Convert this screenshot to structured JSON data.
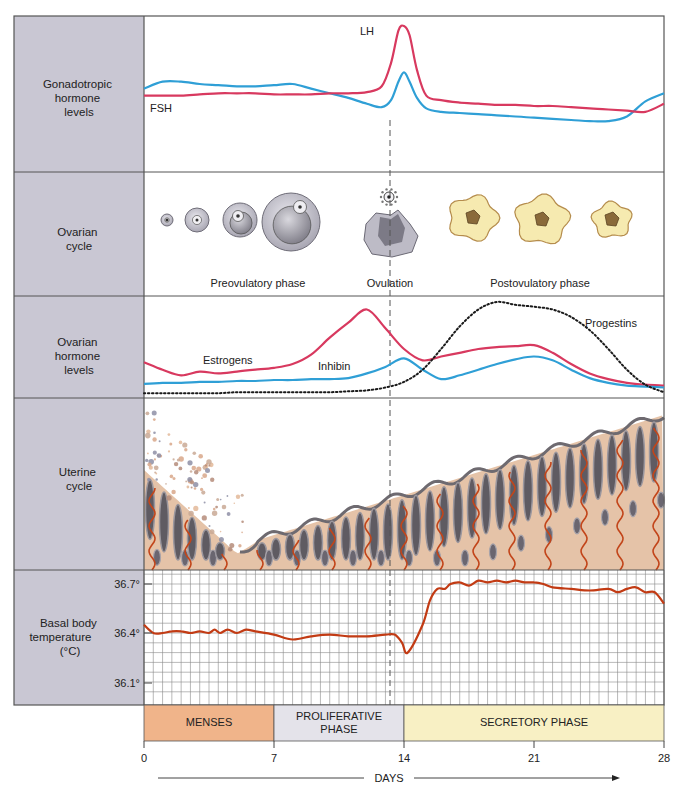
{
  "rows": {
    "gonadotropic": {
      "label_lines": [
        "Gonadotropic",
        "hormone",
        "levels"
      ],
      "fsh_label": "FSH",
      "lh_label": "LH"
    },
    "ovarian_cycle": {
      "label_lines": [
        "Ovarian",
        "cycle"
      ],
      "preovulatory_label": "Preovulatory phase",
      "ovulation_label": "Ovulation",
      "postovulatory_label": "Postovulatory phase"
    },
    "ovarian_hormones": {
      "label_lines": [
        "Ovarian",
        "hormone",
        "levels"
      ],
      "estrogens_label": "Estrogens",
      "inhibin_label": "Inhibin",
      "progestins_label": "Progestins"
    },
    "uterine_cycle": {
      "label_lines": [
        "Uterine",
        "cycle"
      ]
    },
    "bbt": {
      "label_lines": [
        "Basal body",
        "temperature",
        "(°C)"
      ],
      "tick_labels": [
        "36.7°",
        "36.4°",
        "36.1°"
      ]
    }
  },
  "phases": [
    {
      "label_lines": [
        "MENSES"
      ],
      "start_day": 0,
      "end_day": 7,
      "color": "#f0b48a"
    },
    {
      "label_lines": [
        "PROLIFERATIVE",
        "PHASE"
      ],
      "start_day": 7,
      "end_day": 14,
      "color": "#e4e3ea"
    },
    {
      "label_lines": [
        "SECRETORY PHASE"
      ],
      "start_day": 14,
      "end_day": 28,
      "color": "#f8f0c4"
    }
  ],
  "axis": {
    "ticks": [
      "0",
      "7",
      "14",
      "21",
      "28"
    ],
    "label": "DAYS"
  },
  "colors": {
    "fsh": "#2f9fd6",
    "lh": "#d8395f",
    "estrogens": "#d8395f",
    "inhibin": "#2f9fd6",
    "progestins": "#1a1a1a",
    "bbt": "#c23b14",
    "label_panel": "#c9c7d3",
    "frame": "#555555"
  },
  "chart_data": [
    {
      "type": "line",
      "title": "Gonadotropic hormone levels",
      "x": [
        0,
        1,
        2,
        3,
        4,
        5,
        6,
        7,
        8,
        9,
        10,
        11,
        12,
        12.8,
        13.3,
        13.7,
        14,
        14.3,
        14.7,
        15.2,
        16,
        17,
        18,
        19,
        20,
        21,
        22,
        23,
        24,
        25,
        26,
        27,
        28
      ],
      "series": [
        {
          "name": "FSH",
          "values": [
            0.46,
            0.52,
            0.52,
            0.5,
            0.49,
            0.48,
            0.48,
            0.49,
            0.5,
            0.46,
            0.42,
            0.38,
            0.33,
            0.3,
            0.36,
            0.52,
            0.6,
            0.52,
            0.38,
            0.29,
            0.26,
            0.25,
            0.24,
            0.23,
            0.22,
            0.21,
            0.2,
            0.19,
            0.18,
            0.18,
            0.22,
            0.35,
            0.42
          ]
        },
        {
          "name": "LH",
          "values": [
            0.4,
            0.4,
            0.4,
            0.41,
            0.42,
            0.42,
            0.42,
            0.41,
            0.41,
            0.41,
            0.42,
            0.42,
            0.43,
            0.48,
            0.68,
            0.96,
            1.0,
            0.92,
            0.62,
            0.4,
            0.36,
            0.34,
            0.33,
            0.32,
            0.32,
            0.31,
            0.31,
            0.3,
            0.29,
            0.28,
            0.27,
            0.26,
            0.33
          ]
        }
      ],
      "xlabel": "DAYS",
      "ylabel": "Gonadotropic hormone levels",
      "xlim": [
        0,
        28
      ],
      "ylim": [
        0,
        1
      ],
      "annotations": [
        "FSH",
        "LH"
      ]
    },
    {
      "type": "line",
      "title": "Ovarian hormone levels",
      "x": [
        0,
        1,
        2,
        3,
        4,
        5,
        6,
        7,
        8,
        9,
        10,
        11,
        12,
        13,
        14,
        15,
        16,
        17,
        18,
        19,
        20,
        21,
        22,
        23,
        24,
        25,
        26,
        27,
        28
      ],
      "series": [
        {
          "name": "Estrogens",
          "values": [
            0.36,
            0.28,
            0.22,
            0.26,
            0.24,
            0.26,
            0.28,
            0.3,
            0.34,
            0.44,
            0.62,
            0.78,
            0.92,
            0.72,
            0.5,
            0.38,
            0.42,
            0.46,
            0.5,
            0.52,
            0.53,
            0.54,
            0.46,
            0.34,
            0.24,
            0.18,
            0.14,
            0.12,
            0.11
          ]
        },
        {
          "name": "Inhibin",
          "values": [
            0.13,
            0.14,
            0.14,
            0.15,
            0.15,
            0.16,
            0.16,
            0.17,
            0.17,
            0.18,
            0.18,
            0.19,
            0.24,
            0.31,
            0.4,
            0.28,
            0.18,
            0.22,
            0.28,
            0.34,
            0.39,
            0.42,
            0.38,
            0.28,
            0.19,
            0.14,
            0.11,
            0.1,
            0.09
          ]
        },
        {
          "name": "Progestins",
          "values": [
            0.03,
            0.03,
            0.03,
            0.03,
            0.03,
            0.04,
            0.04,
            0.04,
            0.04,
            0.04,
            0.04,
            0.05,
            0.06,
            0.09,
            0.15,
            0.28,
            0.5,
            0.74,
            0.92,
            1.0,
            0.97,
            0.95,
            0.92,
            0.84,
            0.7,
            0.5,
            0.28,
            0.12,
            0.04
          ]
        }
      ],
      "xlabel": "DAYS",
      "ylabel": "Ovarian hormone levels",
      "xlim": [
        0,
        28
      ],
      "ylim": [
        0,
        1
      ],
      "annotations": [
        "Estrogens",
        "Inhibin",
        "Progestins"
      ]
    },
    {
      "type": "line",
      "title": "Basal body temperature (°C)",
      "x": [
        0,
        0.5,
        1,
        1.5,
        2,
        2.5,
        3,
        3.5,
        3.8,
        4.1,
        4.5,
        5,
        5.5,
        6,
        7,
        8,
        9,
        10,
        11,
        12,
        13,
        13.5,
        13.9,
        14.2,
        15,
        15.4,
        15.8,
        16.2,
        16.5,
        17,
        17.5,
        18,
        18.5,
        19,
        19.5,
        20,
        20.5,
        21,
        21.5,
        22,
        23,
        24,
        25,
        25.5,
        26,
        26.5,
        27,
        27.5,
        28
      ],
      "series": [
        {
          "name": "Basal body temperature",
          "values": [
            36.45,
            36.4,
            36.4,
            36.41,
            36.41,
            36.4,
            36.41,
            36.4,
            36.42,
            36.4,
            36.42,
            36.4,
            36.42,
            36.41,
            36.39,
            36.36,
            36.38,
            36.39,
            36.38,
            36.38,
            36.39,
            36.39,
            36.34,
            36.28,
            36.45,
            36.6,
            36.67,
            36.67,
            36.7,
            36.71,
            36.69,
            36.72,
            36.71,
            36.72,
            36.71,
            36.72,
            36.71,
            36.71,
            36.7,
            36.68,
            36.67,
            36.66,
            36.67,
            36.65,
            36.67,
            36.68,
            36.65,
            36.65,
            36.58
          ]
        }
      ],
      "xlabel": "DAYS",
      "ylabel": "Basal body temperature (°C)",
      "xlim": [
        0,
        28
      ],
      "ylim": [
        36.0,
        36.8
      ],
      "yticks": [
        36.1,
        36.4,
        36.7
      ],
      "grid": true
    }
  ]
}
